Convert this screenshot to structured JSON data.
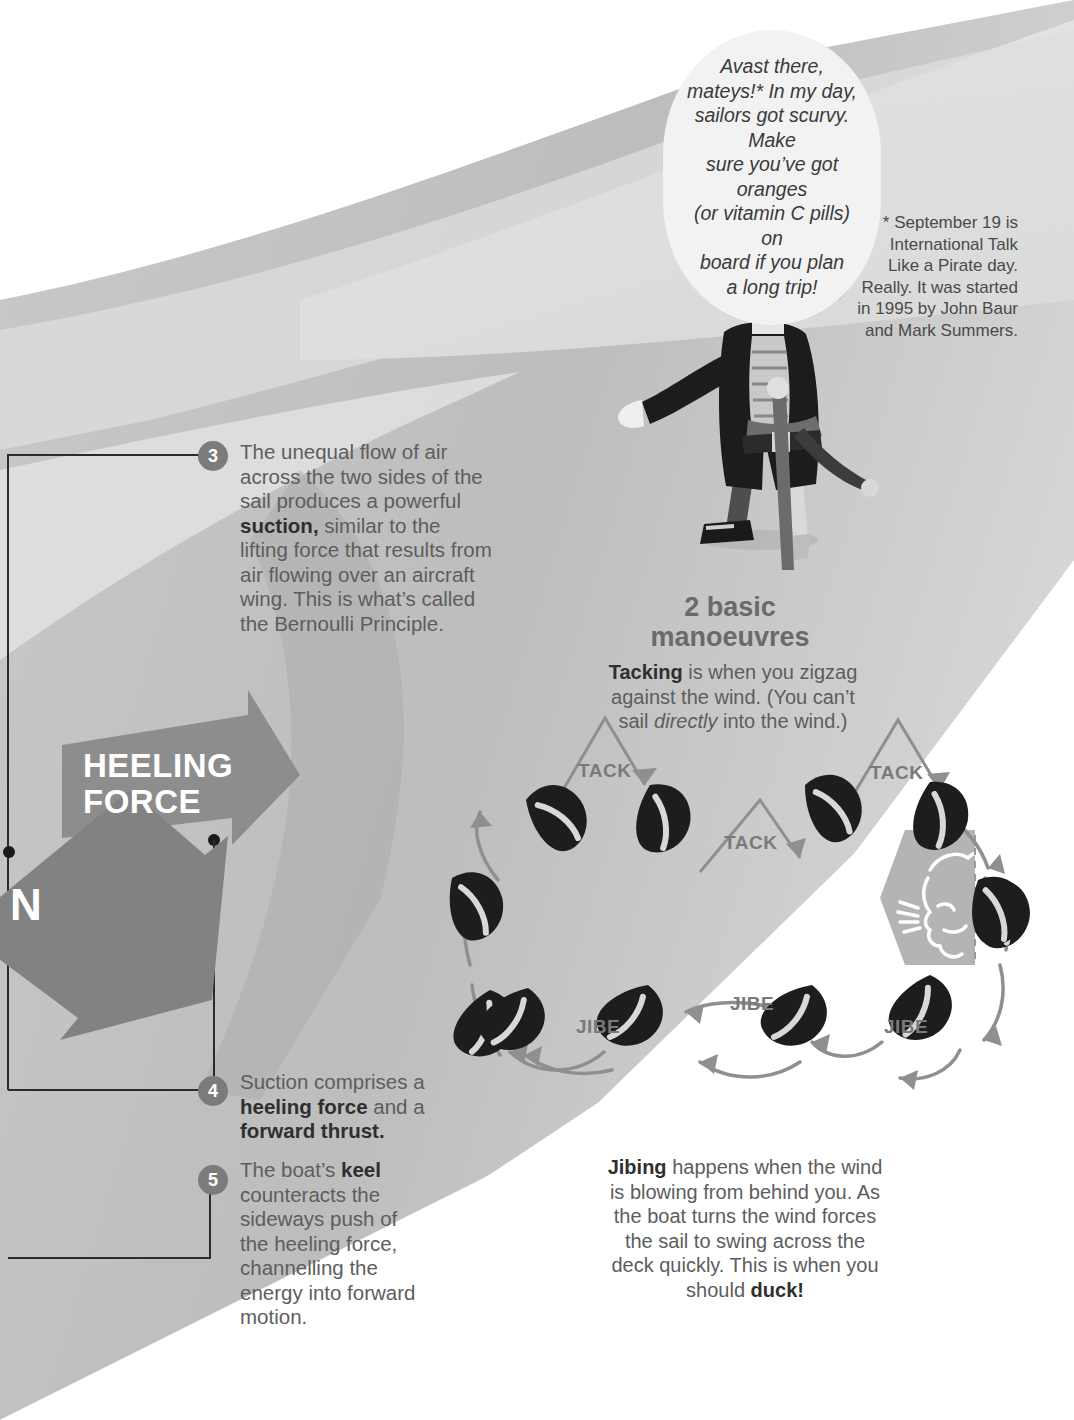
{
  "palette": {
    "page_bg": "#ffffff",
    "band_grey": "#b8b8b8",
    "band_light": "#d2d2d2",
    "band_pale": "#e8e8e8",
    "arrow_grey": "#8a8a8a",
    "bullet_grey": "#7b7b7b",
    "body_text": "#5d5d5d",
    "bold_text": "#2f2f2f",
    "label_grey": "#7a7a7a",
    "boat_dark": "#1d1d1d",
    "bubble_fill": "#f2f2f2"
  },
  "speech_bubble": {
    "icon": "speech-bubble",
    "lines": [
      "Avast there,",
      "mateys!* In my day,",
      "sailors got scurvy. Make",
      "sure you’ve got oranges",
      "(or vitamin C pills) on",
      "board if you plan",
      "a long trip!"
    ]
  },
  "footnote": {
    "lines": [
      "* September 19 is",
      "International Talk",
      "Like a Pirate day.",
      "Really. It was started",
      "in 1995 by John Baur",
      "and Mark Summers."
    ]
  },
  "pirate": {
    "icon": "pirate-illustration",
    "alt": "Pirate with tricorn hat, eyepatch, peg leg and cane, pointing left"
  },
  "steps": [
    {
      "number": "3",
      "segments": [
        {
          "text": "The unequal flow of air across the two sides of the sail produces a powerful ",
          "bold": false
        },
        {
          "text": "suction,",
          "bold": true
        },
        {
          "text": " similar to the lifting force that results from air flowing over an aircraft wing. This is what’s called the Bernoulli Principle.",
          "bold": false
        }
      ]
    },
    {
      "number": "4",
      "segments": [
        {
          "text": "Suction comprises a ",
          "bold": false
        },
        {
          "text": "heeling force",
          "bold": true
        },
        {
          "text": " and a ",
          "bold": false
        },
        {
          "text": "forward thrust.",
          "bold": true
        }
      ]
    },
    {
      "number": "5",
      "segments": [
        {
          "text": "The boat’s ",
          "bold": false
        },
        {
          "text": "keel",
          "bold": true
        },
        {
          "text": " counteracts the sideways push of the heeling force, channelling the energy into forward motion.",
          "bold": false
        }
      ]
    }
  ],
  "force_arrows": [
    {
      "label_line1": "HEELING",
      "label_line2": "FORCE",
      "direction": "right"
    },
    {
      "label": "N",
      "full_word": "SUCTION",
      "direction": "down-left"
    }
  ],
  "manoeuvres": {
    "title_line1": "2 basic",
    "title_line2": "manoeuvres",
    "tacking_segments": [
      {
        "text": "Tacking",
        "style": "bold"
      },
      {
        "text": " is when you zigzag against the wind. (You can’t sail ",
        "style": "normal"
      },
      {
        "text": "directly",
        "style": "italic"
      },
      {
        "text": " into the wind.)",
        "style": "normal"
      }
    ],
    "jibing_segments": [
      {
        "text": "Jibing",
        "style": "bold"
      },
      {
        "text": " happens when the wind is blowing from behind you. As the boat turns the wind forces the sail to swing across the deck quickly. This is when you should ",
        "style": "normal"
      },
      {
        "text": "duck!",
        "style": "bold"
      }
    ],
    "tack_labels": [
      "TACK",
      "TACK",
      "TACK"
    ],
    "jibe_labels": [
      "JIBE",
      "JIBE",
      "JIBE"
    ],
    "wind_icon": "wind-blowing-face-icon",
    "boat_count": 12
  }
}
